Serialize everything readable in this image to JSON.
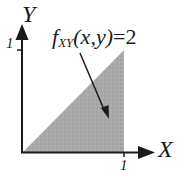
{
  "diagram": {
    "type": "region-plot",
    "axes": {
      "x_label": "X",
      "y_label": "Y",
      "x_tick": "1",
      "y_tick": "1"
    },
    "annotation": {
      "func": "f",
      "subscript": "XY",
      "args": "(x,y)",
      "equals": "=2"
    },
    "region": {
      "shape": "triangle",
      "vertices": [
        [
          0,
          0
        ],
        [
          1,
          0
        ],
        [
          1,
          1
        ]
      ],
      "fill": "#a8a8a8"
    },
    "colors": {
      "ink": "#1a1a1a",
      "shade": "#a8a8a8",
      "background": "#ffffff"
    }
  }
}
